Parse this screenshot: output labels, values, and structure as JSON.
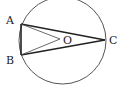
{
  "diagram": {
    "type": "geometry-circle",
    "circle": {
      "cx": 62.5,
      "cy": 40.5,
      "r": 43.5,
      "stroke": "#555555"
    },
    "points": {
      "A": {
        "x": 21,
        "y": 24,
        "label": "A",
        "lx": 6,
        "ly": 24
      },
      "B": {
        "x": 21,
        "y": 55,
        "label": "B",
        "lx": 6,
        "ly": 64
      },
      "O": {
        "x": 60,
        "y": 39,
        "label": "O",
        "lx": 63,
        "ly": 43
      },
      "C": {
        "x": 105,
        "y": 40,
        "label": "C",
        "lx": 109,
        "ly": 44
      }
    },
    "segments": [
      {
        "from": "A",
        "to": "B",
        "weight": "bold"
      },
      {
        "from": "A",
        "to": "C",
        "weight": "bold"
      },
      {
        "from": "B",
        "to": "C",
        "weight": "bold"
      },
      {
        "from": "A",
        "to": "O",
        "weight": "thin"
      },
      {
        "from": "B",
        "to": "O",
        "weight": "thin"
      }
    ],
    "labels": {
      "A": "A",
      "B": "B",
      "O": "O",
      "C": "C"
    }
  }
}
